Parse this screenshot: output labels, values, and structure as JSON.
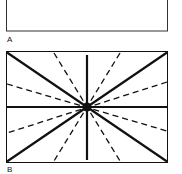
{
  "panels": [
    {
      "id": "A",
      "label": "A",
      "description": "Empty rectangle"
    },
    {
      "id": "B",
      "label": "B",
      "description": "Rectangle with radiating lines from center: solid diagonals, solid horizontal and vertical axes, dashed intermediate lines"
    }
  ],
  "colors": {
    "stroke": "#111111",
    "background": "#ffffff"
  }
}
